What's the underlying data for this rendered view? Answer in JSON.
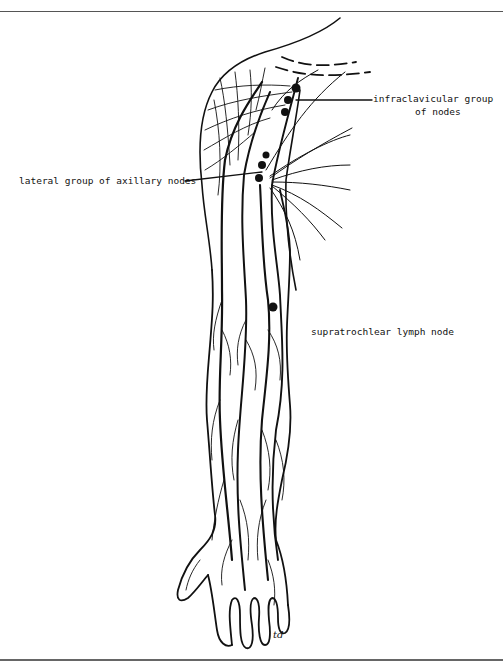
{
  "figure": {
    "labels": {
      "infraclavicular_line1": "infraclavicular group",
      "infraclavicular_line2": "of nodes",
      "lateral_axillary": "lateral group of axillary nodes",
      "supratrochlear": "supratrochlear lymph node"
    },
    "signature": "td"
  },
  "colors": {
    "ink": "#111111",
    "background": "#ffffff",
    "rule": "#555555"
  }
}
